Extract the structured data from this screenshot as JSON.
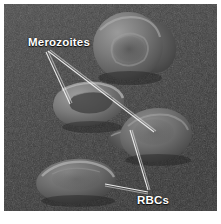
{
  "figure": {
    "kind": "scanning-electron-micrograph",
    "border_color": "#ffffff",
    "background_color": "#3a3a3a"
  },
  "annotations": {
    "merozoites": {
      "label": "Merozoites",
      "color": "#ffffff",
      "leader_lines": 2
    },
    "rbcs": {
      "label": "RBCs",
      "color": "#ffffff",
      "leader_lines": 2
    }
  },
  "specimens": [
    {
      "name": "rbc-top-right",
      "type": "red-blood-cell"
    },
    {
      "name": "rbc-top-right-lobe",
      "type": "red-blood-cell"
    },
    {
      "name": "rbc-middle-left",
      "type": "red-blood-cell"
    },
    {
      "name": "rbc-middle-right",
      "type": "red-blood-cell"
    },
    {
      "name": "merozoite-bud",
      "type": "merozoite"
    },
    {
      "name": "rbc-bottom-left",
      "type": "red-blood-cell"
    }
  ]
}
